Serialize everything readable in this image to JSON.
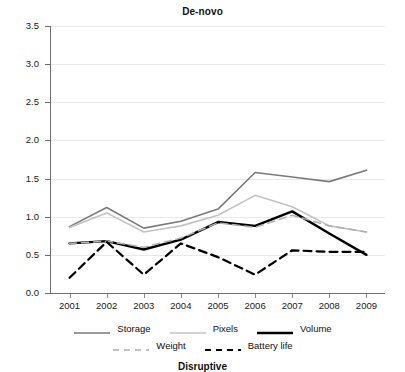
{
  "chart_data": {
    "type": "line",
    "title": "De-novo",
    "xlabel": "",
    "ylabel": "",
    "x": [
      2001,
      2002,
      2003,
      2004,
      2005,
      2006,
      2007,
      2008,
      2009
    ],
    "categories": [
      "2001",
      "2002",
      "2003",
      "2004",
      "2005",
      "2006",
      "2007",
      "2008",
      "2009"
    ],
    "ylim": [
      0.0,
      3.5
    ],
    "ytick_labels": [
      "0.0",
      "0.5",
      "1.0",
      "1.5",
      "2.0",
      "2.5",
      "3.0",
      "3.5"
    ],
    "ytick_values": [
      0.0,
      0.5,
      1.0,
      1.5,
      2.0,
      2.5,
      3.0,
      3.5
    ],
    "grid": true,
    "grid_color": "#e9e9e9",
    "legend_position": "bottom",
    "series": [
      {
        "name": "Storage",
        "values": [
          0.87,
          1.12,
          0.85,
          0.94,
          1.1,
          1.58,
          1.52,
          1.46,
          1.61
        ],
        "color": "#7a7a7a",
        "style": "solid",
        "width": 1.6
      },
      {
        "name": "Pixels",
        "values": [
          0.86,
          1.05,
          0.8,
          0.88,
          1.02,
          1.28,
          1.13,
          0.88,
          0.8
        ],
        "color": "#c2c2c2",
        "style": "solid",
        "width": 1.6
      },
      {
        "name": "Volume",
        "values": [
          0.65,
          0.68,
          0.57,
          0.7,
          0.93,
          0.88,
          1.07,
          0.78,
          0.5
        ],
        "color": "#000000",
        "style": "solid",
        "width": 2.4
      },
      {
        "name": "Weight",
        "values": [
          0.65,
          0.68,
          0.6,
          0.72,
          0.92,
          0.86,
          1.02,
          0.88,
          0.8
        ],
        "color": "#b0b0b0",
        "style": "dashed",
        "width": 1.6
      },
      {
        "name": "Battery life",
        "values": [
          0.2,
          0.67,
          0.24,
          0.65,
          0.47,
          0.24,
          0.56,
          0.54,
          0.54
        ],
        "color": "#000000",
        "style": "dashed",
        "width": 2.2
      }
    ]
  },
  "bottom": {
    "next_chart_title": "Disruptive"
  }
}
